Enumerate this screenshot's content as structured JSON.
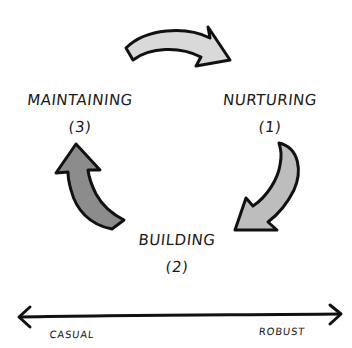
{
  "diagram": {
    "type": "cycle",
    "stages": [
      {
        "name": "NURTURING",
        "order": "(1)"
      },
      {
        "name": "BUILDING",
        "order": "(2)"
      },
      {
        "name": "MAINTAINING",
        "order": "(3)"
      }
    ],
    "arrows": [
      {
        "from": "MAINTAINING",
        "to": "NURTURING",
        "fill": "#d9d9d9"
      },
      {
        "from": "NURTURING",
        "to": "BUILDING",
        "fill": "#bdbdbd"
      },
      {
        "from": "BUILDING",
        "to": "MAINTAINING",
        "fill": "#8c8c8c"
      }
    ],
    "scale": {
      "left_label": "CASUAL",
      "right_label": "ROBUST"
    },
    "colors": {
      "stroke": "#111111",
      "background": "#ffffff"
    }
  }
}
